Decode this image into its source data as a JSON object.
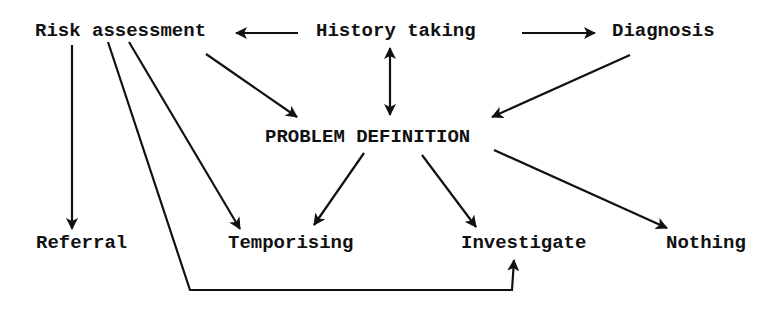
{
  "diagram": {
    "nodes": [
      {
        "id": "risk",
        "label": "Risk assessment",
        "x": 35,
        "y": 22
      },
      {
        "id": "history",
        "label": "History taking",
        "x": 316,
        "y": 22
      },
      {
        "id": "diagnosis",
        "label": "Diagnosis",
        "x": 612,
        "y": 22
      },
      {
        "id": "problem",
        "label": "PROBLEM DEFINITION",
        "x": 265,
        "y": 128
      },
      {
        "id": "referral",
        "label": "Referral",
        "x": 36,
        "y": 234
      },
      {
        "id": "temporising",
        "label": "Temporising",
        "x": 228,
        "y": 234
      },
      {
        "id": "investigate",
        "label": "Investigate",
        "x": 461,
        "y": 234
      },
      {
        "id": "nothing",
        "label": "Nothing",
        "x": 666,
        "y": 234
      }
    ],
    "edges": [
      {
        "from": "history",
        "to": "risk",
        "points": [
          [
            298,
            33
          ],
          [
            236,
            33
          ]
        ],
        "bidirectional": false
      },
      {
        "from": "history",
        "to": "diagnosis",
        "points": [
          [
            522,
            33
          ],
          [
            595,
            33
          ]
        ],
        "bidirectional": false
      },
      {
        "from": "history",
        "to": "problem",
        "points": [
          [
            390,
            48
          ],
          [
            390,
            115
          ]
        ],
        "bidirectional": true
      },
      {
        "from": "risk",
        "to": "problem",
        "points": [
          [
            206,
            54
          ],
          [
            297,
            117
          ]
        ],
        "bidirectional": false
      },
      {
        "from": "diagnosis",
        "to": "problem",
        "points": [
          [
            630,
            55
          ],
          [
            492,
            117
          ]
        ],
        "bidirectional": false
      },
      {
        "from": "risk",
        "to": "referral",
        "points": [
          [
            72,
            45
          ],
          [
            72,
            229
          ]
        ],
        "bidirectional": false
      },
      {
        "from": "risk",
        "to": "temporising",
        "points": [
          [
            129,
            42
          ],
          [
            240,
            229
          ]
        ],
        "bidirectional": false
      },
      {
        "from": "risk",
        "to": "investigate",
        "points": [
          [
            108,
            42
          ],
          [
            190,
            290
          ],
          [
            512,
            290
          ],
          [
            514,
            260
          ]
        ],
        "bidirectional": false
      },
      {
        "from": "problem",
        "to": "temporising",
        "points": [
          [
            364,
            153
          ],
          [
            314,
            225
          ]
        ],
        "bidirectional": false
      },
      {
        "from": "problem",
        "to": "investigate",
        "points": [
          [
            422,
            155
          ],
          [
            476,
            227
          ]
        ],
        "bidirectional": false
      },
      {
        "from": "problem",
        "to": "nothing",
        "points": [
          [
            494,
            150
          ],
          [
            667,
            228
          ]
        ],
        "bidirectional": false
      }
    ],
    "colors": {
      "ink": "#111111",
      "background": "#ffffff"
    }
  }
}
